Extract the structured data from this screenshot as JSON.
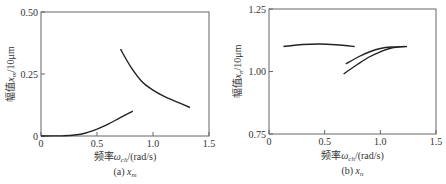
{
  "chart_data": [
    {
      "type": "line",
      "title": "",
      "caption": "(a) x_m",
      "caption_prefix": "(a)",
      "caption_var": "x",
      "caption_sub": "m",
      "xlabel": "频率ω_ch/(rad/s)",
      "xlabel_prefix": "频率",
      "xlabel_var": "ω",
      "xlabel_sub": "ch",
      "xlabel_unit": "/(rad/s)",
      "ylabel": "幅值x_m/10μm",
      "ylabel_prefix": "幅值",
      "ylabel_var": "x",
      "ylabel_sub": "m",
      "ylabel_unit": "/10μm",
      "xlim": [
        0,
        1.5
      ],
      "ylim": [
        0,
        0.5
      ],
      "xticks": [
        "0",
        "0.5",
        "1.0",
        "1.5"
      ],
      "yticks": [
        "0",
        "0.25",
        "0.50"
      ],
      "grid": false,
      "series": [
        {
          "name": "lower-branch",
          "x": [
            0,
            0.2,
            0.3,
            0.4,
            0.5,
            0.6,
            0.7,
            0.82
          ],
          "y": [
            0,
            0.001,
            0.004,
            0.012,
            0.028,
            0.048,
            0.072,
            0.1
          ]
        },
        {
          "name": "upper-branch",
          "x": [
            0.71,
            0.8,
            0.9,
            1.0,
            1.1,
            1.2,
            1.33
          ],
          "y": [
            0.35,
            0.28,
            0.22,
            0.185,
            0.16,
            0.14,
            0.115
          ]
        }
      ]
    },
    {
      "type": "line",
      "title": "",
      "caption": "(b) x_n",
      "caption_prefix": "(b)",
      "caption_var": "x",
      "caption_sub": "n",
      "xlabel": "频率ω_ch/(rad/s)",
      "xlabel_prefix": "频率",
      "xlabel_var": "ω",
      "xlabel_sub": "ch",
      "xlabel_unit": "/(rad/s)",
      "ylabel": "幅值x_n/10μm",
      "ylabel_prefix": "幅值",
      "ylabel_var": "x",
      "ylabel_sub": "n",
      "ylabel_unit": "/10μm",
      "xlim": [
        0,
        1.5
      ],
      "ylim": [
        0.75,
        1.25
      ],
      "xticks": [
        "0",
        "0.5",
        "1.0",
        "1.5"
      ],
      "yticks": [
        "0.75",
        "1.00",
        "1.25"
      ],
      "grid": false,
      "series": [
        {
          "name": "flat-branch",
          "x": [
            0.13,
            0.3,
            0.45,
            0.6,
            0.77
          ],
          "y": [
            1.1,
            1.108,
            1.11,
            1.107,
            1.1
          ]
        },
        {
          "name": "upper-rising-branch",
          "x": [
            0.69,
            0.8,
            0.9,
            1.0,
            1.1,
            1.22
          ],
          "y": [
            1.03,
            1.058,
            1.078,
            1.092,
            1.098,
            1.1
          ]
        },
        {
          "name": "lower-rising-branch",
          "x": [
            0.67,
            0.8,
            0.9,
            1.0,
            1.1,
            1.24
          ],
          "y": [
            0.99,
            1.03,
            1.058,
            1.079,
            1.094,
            1.1
          ]
        }
      ]
    }
  ]
}
